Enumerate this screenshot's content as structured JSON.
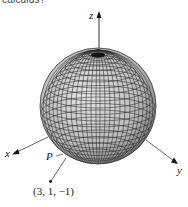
{
  "caption": "calculus?",
  "axes": {
    "x_label": "x",
    "y_label": "y",
    "z_label": "z"
  },
  "point": {
    "label": "P",
    "coords": "(3, 1, −1)"
  },
  "colors": {
    "axis": "#333333",
    "sphere_fill": "#c8c8c8",
    "grid": "#2a2a2a"
  }
}
